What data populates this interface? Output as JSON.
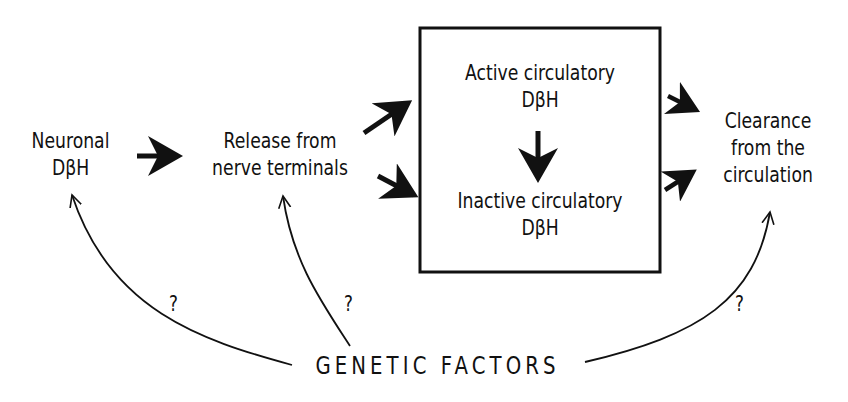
{
  "nodes": {
    "neuronal": {
      "line1": "Neuronal",
      "line2": "DβH"
    },
    "release": {
      "line1": "Release from",
      "line2": "nerve terminals"
    },
    "active": {
      "line1": "Active circulatory",
      "line2": "DβH"
    },
    "inactive": {
      "line1": "Inactive circulatory",
      "line2": "DβH"
    },
    "clearance": {
      "line1": "Clearance",
      "line2": "from the",
      "line3": "circulation"
    },
    "genetic": {
      "label": "GENETIC FACTORS"
    }
  },
  "uncertainty_marks": [
    "?",
    "?",
    "?"
  ],
  "colors": {
    "ink": "#111111",
    "background": "#ffffff"
  }
}
